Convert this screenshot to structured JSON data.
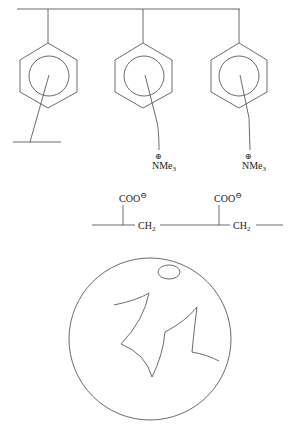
{
  "diagram": {
    "title": "",
    "resin": {
      "description": "polystyrene backbone with pendant benzene rings",
      "groups": [
        {
          "label": "crosslink",
          "type": "crosslink"
        },
        {
          "label": "NMe3",
          "charge": "⊕",
          "type": "quaternary ammonium"
        },
        {
          "label": "NMe3",
          "charge": "⊕",
          "type": "quaternary ammonium"
        }
      ]
    },
    "polyacrylate": {
      "units": [
        {
          "substituent": "COO",
          "charge": "⊖",
          "linker": "CH2"
        },
        {
          "substituent": "COO",
          "charge": "⊖",
          "linker": "CH2"
        }
      ]
    },
    "bead": {
      "description": "porous resin bead with pore channels and small cavity"
    },
    "labels": {
      "nme3_1": "NMe",
      "nme3_1_sub": "3",
      "nme3_2": "NMe",
      "nme3_2_sub": "3",
      "plus": "⊕",
      "coo_1": "COO",
      "coo_2": "COO",
      "minus": "⊖",
      "ch2_1": "CH",
      "ch2_1_sub": "2",
      "ch2_2": "CH",
      "ch2_2_sub": "2"
    },
    "colors": {
      "line": "#5a5a5a",
      "text": "#222222",
      "background": "#ffffff"
    }
  }
}
